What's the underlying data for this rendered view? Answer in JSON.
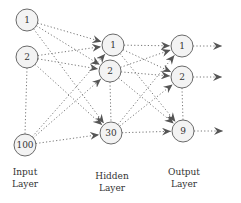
{
  "diagram": {
    "layers": [
      {
        "name": "input",
        "label_line1": "Input",
        "label_line2": "Layer",
        "nodes": [
          {
            "label": "1",
            "x": 27,
            "y": 20
          },
          {
            "label": "2",
            "x": 27,
            "y": 57
          },
          {
            "label": "100",
            "x": 25,
            "y": 145
          }
        ]
      },
      {
        "name": "hidden",
        "label_line1": "Hidden",
        "label_line2": "Layer",
        "nodes": [
          {
            "label": "1",
            "x": 113,
            "y": 45
          },
          {
            "label": "2",
            "x": 110,
            "y": 71
          },
          {
            "label": "30",
            "x": 111,
            "y": 133
          }
        ]
      },
      {
        "name": "output",
        "label_line1": "Output",
        "label_line2": "Layer",
        "nodes": [
          {
            "label": "1",
            "x": 182,
            "y": 46
          },
          {
            "label": "2",
            "x": 182,
            "y": 77
          },
          {
            "label": "9",
            "x": 183,
            "y": 131
          }
        ]
      }
    ],
    "colors": {
      "node_fill": "#f3f3f3",
      "node_stroke": "#6a6a6a",
      "edge": "#777777",
      "text": "#333333"
    }
  }
}
